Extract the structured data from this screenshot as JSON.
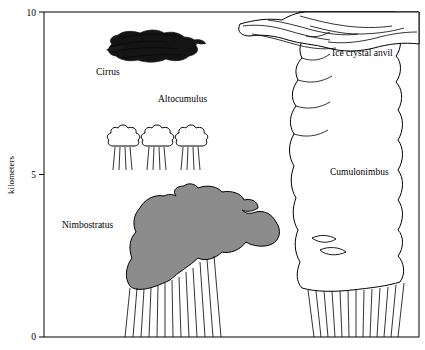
{
  "figure": {
    "axis": {
      "y_title": "kilometers",
      "y_ticks": [
        "10",
        "5",
        "0"
      ],
      "y_tick_values": [
        10,
        5,
        0
      ],
      "y_range": [
        0,
        10
      ]
    },
    "labels": {
      "cirrus": "Cirrus",
      "altocumulus": "Altocumulus",
      "nimbostratus": "Nimbostratus",
      "ice_crystal_anvil": "Ice crystal anvil",
      "cumulonimbus": "Cumulonimbus"
    },
    "colors": {
      "cirrus_fill": "#1a1a1a",
      "nimbostratus_fill": "#8c8c8c",
      "outline": "#000000",
      "background": "#ffffff",
      "cumulonimbus_fill": "#ffffff"
    }
  }
}
